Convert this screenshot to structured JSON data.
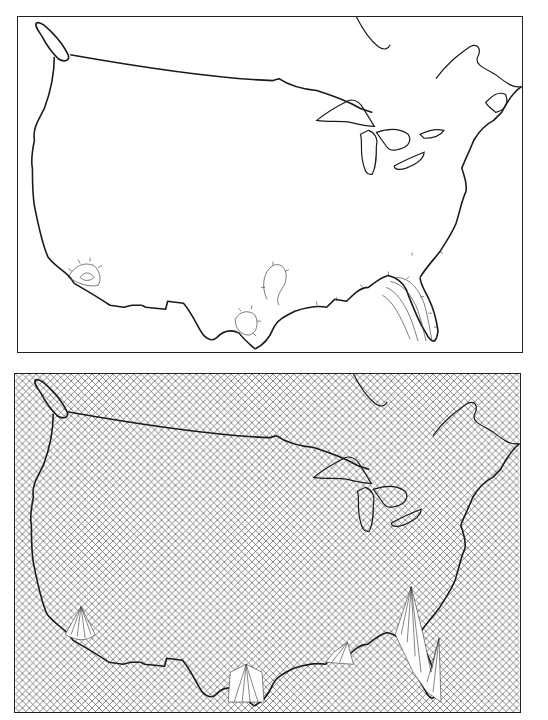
{
  "figure": {
    "panels": [
      {
        "id": "top",
        "kind": "contour-map",
        "region": "Contiguous United States with southern Canada",
        "features": [
          "coastline",
          "US-Canada border",
          "Great Lakes",
          "Hudson Bay / James Bay",
          "Gulf of St. Lawrence",
          "closed contours with hachure ticks near Southern California, Texas Gulf coast, Louisiana/Mississippi coast, and Florida"
        ]
      },
      {
        "id": "bottom",
        "kind": "perspective-surface-map",
        "region": "Contiguous United States with southern Canada",
        "features": [
          "cross-hatched mesh background",
          "coastline",
          "raised peaks over Southern California, South Texas, Gulf coast, and Florida"
        ]
      }
    ],
    "colors": {
      "line": "#1a1a1a",
      "background": "#ffffff",
      "mesh": "#555555"
    }
  }
}
